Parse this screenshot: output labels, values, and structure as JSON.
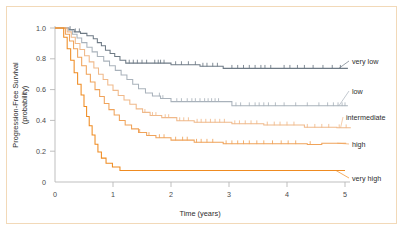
{
  "figure": {
    "border_color": "#f2d9b8",
    "background": "#ffffff"
  },
  "axes": {
    "x_title": "Time  (years)",
    "y_title_line1": "Progression-Free Survival",
    "y_title_line2": "(probability)",
    "x_ticks": [
      "0",
      "1",
      "2",
      "3",
      "4",
      "5"
    ],
    "y_ticks": [
      "0",
      "0.2",
      "0.4",
      "0.6",
      "0.8",
      "1.0"
    ],
    "axis_color": "#b8b8b8",
    "tick_text_color": "#4a4a4a"
  },
  "series_labels": {
    "very_low": "very low",
    "low": "low",
    "intermediate": "intermediate",
    "high": "high",
    "very_high": "very high"
  },
  "chart_data": {
    "type": "line",
    "title": "",
    "subtitle": "",
    "xlabel": "Time  (years)",
    "ylabel": "Progression-Free Survival (probability)",
    "xlim": [
      0,
      5.2
    ],
    "ylim": [
      0,
      1.05
    ],
    "xticks": [
      0,
      1,
      2,
      3,
      4,
      5
    ],
    "yticks": [
      0,
      0.2,
      0.4,
      0.6,
      0.8,
      1.0
    ],
    "grid": false,
    "legend_position": "right-inline-annotations",
    "curve_style": "kaplan-meier step function with censoring tick marks",
    "series": [
      {
        "name": "very low",
        "color": "#6e7a85",
        "plateau": 0.73,
        "final_value": 0.73,
        "steps": [
          [
            0.0,
            1.0
          ],
          [
            0.22,
            1.0
          ],
          [
            0.24,
            0.99
          ],
          [
            0.3,
            0.99
          ],
          [
            0.33,
            0.975
          ],
          [
            0.4,
            0.975
          ],
          [
            0.44,
            0.965
          ],
          [
            0.5,
            0.965
          ],
          [
            0.55,
            0.95
          ],
          [
            0.62,
            0.95
          ],
          [
            0.66,
            0.93
          ],
          [
            0.7,
            0.93
          ],
          [
            0.73,
            0.905
          ],
          [
            0.78,
            0.905
          ],
          [
            0.8,
            0.885
          ],
          [
            0.84,
            0.885
          ],
          [
            0.87,
            0.855
          ],
          [
            0.92,
            0.855
          ],
          [
            0.95,
            0.835
          ],
          [
            1.0,
            0.835
          ],
          [
            1.03,
            0.815
          ],
          [
            1.08,
            0.815
          ],
          [
            1.12,
            0.79
          ],
          [
            1.18,
            0.79
          ],
          [
            1.22,
            0.772
          ],
          [
            1.95,
            0.772
          ],
          [
            2.0,
            0.762
          ],
          [
            2.45,
            0.762
          ],
          [
            2.5,
            0.752
          ],
          [
            2.85,
            0.752
          ],
          [
            2.9,
            0.738
          ],
          [
            5.05,
            0.738
          ]
        ],
        "censor_times": [
          0.26,
          0.35,
          0.42,
          1.28,
          1.35,
          1.42,
          1.5,
          1.58,
          1.72,
          1.78,
          1.82,
          1.88,
          2.08,
          2.18,
          2.3,
          2.42,
          2.55,
          2.62,
          2.72,
          2.8,
          3.05,
          3.15,
          3.25,
          3.35,
          3.45,
          3.55,
          3.62,
          3.72,
          3.95,
          4.05,
          4.18,
          4.3,
          4.45,
          4.62,
          4.78,
          4.92
        ]
      },
      {
        "name": "low",
        "color": "#a9b2bb",
        "plateau": 0.495,
        "final_value": 0.495,
        "steps": [
          [
            0.0,
            1.0
          ],
          [
            0.2,
            1.0
          ],
          [
            0.23,
            0.985
          ],
          [
            0.27,
            0.985
          ],
          [
            0.3,
            0.96
          ],
          [
            0.35,
            0.96
          ],
          [
            0.38,
            0.935
          ],
          [
            0.43,
            0.935
          ],
          [
            0.46,
            0.905
          ],
          [
            0.52,
            0.905
          ],
          [
            0.55,
            0.875
          ],
          [
            0.6,
            0.875
          ],
          [
            0.64,
            0.845
          ],
          [
            0.7,
            0.845
          ],
          [
            0.73,
            0.815
          ],
          [
            0.8,
            0.815
          ],
          [
            0.84,
            0.785
          ],
          [
            0.9,
            0.785
          ],
          [
            0.94,
            0.755
          ],
          [
            1.0,
            0.755
          ],
          [
            1.04,
            0.725
          ],
          [
            1.1,
            0.725
          ],
          [
            1.14,
            0.695
          ],
          [
            1.2,
            0.695
          ],
          [
            1.24,
            0.665
          ],
          [
            1.3,
            0.665
          ],
          [
            1.34,
            0.635
          ],
          [
            1.4,
            0.635
          ],
          [
            1.44,
            0.605
          ],
          [
            1.52,
            0.605
          ],
          [
            1.56,
            0.578
          ],
          [
            1.64,
            0.578
          ],
          [
            1.68,
            0.558
          ],
          [
            1.78,
            0.558
          ],
          [
            1.82,
            0.542
          ],
          [
            1.95,
            0.542
          ],
          [
            2.0,
            0.522
          ],
          [
            3.0,
            0.522
          ],
          [
            3.05,
            0.495
          ],
          [
            5.05,
            0.495
          ]
        ],
        "censor_times": [
          1.8,
          1.86,
          2.1,
          2.18,
          2.28,
          2.36,
          2.42,
          2.5,
          2.58,
          2.64,
          2.7,
          2.76,
          2.82,
          3.12,
          3.2,
          3.35,
          3.45,
          3.52,
          3.6,
          3.68,
          3.8,
          3.95,
          4.15,
          4.35,
          4.55,
          4.7,
          4.8,
          4.88,
          4.95,
          5.0
        ]
      },
      {
        "name": "intermediate",
        "color": "#f0b98a",
        "plateau": 0.355,
        "final_value": 0.352,
        "steps": [
          [
            0.0,
            1.0
          ],
          [
            0.18,
            1.0
          ],
          [
            0.21,
            0.975
          ],
          [
            0.25,
            0.975
          ],
          [
            0.28,
            0.94
          ],
          [
            0.32,
            0.94
          ],
          [
            0.35,
            0.9
          ],
          [
            0.4,
            0.9
          ],
          [
            0.43,
            0.86
          ],
          [
            0.48,
            0.86
          ],
          [
            0.51,
            0.82
          ],
          [
            0.56,
            0.82
          ],
          [
            0.59,
            0.78
          ],
          [
            0.64,
            0.78
          ],
          [
            0.67,
            0.74
          ],
          [
            0.72,
            0.74
          ],
          [
            0.75,
            0.7
          ],
          [
            0.8,
            0.7
          ],
          [
            0.83,
            0.665
          ],
          [
            0.88,
            0.665
          ],
          [
            0.91,
            0.63
          ],
          [
            0.97,
            0.63
          ],
          [
            1.0,
            0.595
          ],
          [
            1.06,
            0.595
          ],
          [
            1.09,
            0.562
          ],
          [
            1.15,
            0.562
          ],
          [
            1.19,
            0.532
          ],
          [
            1.25,
            0.532
          ],
          [
            1.29,
            0.505
          ],
          [
            1.36,
            0.505
          ],
          [
            1.4,
            0.475
          ],
          [
            1.47,
            0.475
          ],
          [
            1.51,
            0.452
          ],
          [
            1.6,
            0.452
          ],
          [
            1.64,
            0.432
          ],
          [
            1.8,
            0.432
          ],
          [
            1.84,
            0.418
          ],
          [
            2.05,
            0.418
          ],
          [
            2.1,
            0.398
          ],
          [
            2.35,
            0.398
          ],
          [
            2.4,
            0.388
          ],
          [
            3.0,
            0.388
          ],
          [
            3.05,
            0.378
          ],
          [
            3.55,
            0.378
          ],
          [
            3.6,
            0.37
          ],
          [
            4.25,
            0.37
          ],
          [
            4.3,
            0.355
          ],
          [
            4.82,
            0.355
          ],
          [
            4.86,
            0.352
          ],
          [
            5.1,
            0.352
          ]
        ],
        "censor_times": [
          1.55,
          1.68,
          1.74,
          1.9,
          1.96,
          2.15,
          2.22,
          2.3,
          2.45,
          2.52,
          2.6,
          2.68,
          2.76,
          2.84,
          2.92,
          3.1,
          3.18,
          3.28,
          3.38,
          3.48,
          3.66,
          3.78,
          3.88,
          4.0,
          4.12,
          4.35,
          4.48,
          4.6,
          4.72,
          4.9,
          5.02
        ]
      },
      {
        "name": "high",
        "color": "#f0a35a",
        "plateau": 0.243,
        "final_value": 0.252,
        "steps": [
          [
            0.0,
            1.0
          ],
          [
            0.15,
            1.0
          ],
          [
            0.18,
            0.96
          ],
          [
            0.22,
            0.96
          ],
          [
            0.25,
            0.915
          ],
          [
            0.29,
            0.915
          ],
          [
            0.32,
            0.865
          ],
          [
            0.36,
            0.865
          ],
          [
            0.39,
            0.81
          ],
          [
            0.43,
            0.81
          ],
          [
            0.46,
            0.755
          ],
          [
            0.51,
            0.755
          ],
          [
            0.54,
            0.7
          ],
          [
            0.58,
            0.7
          ],
          [
            0.61,
            0.65
          ],
          [
            0.66,
            0.65
          ],
          [
            0.69,
            0.6
          ],
          [
            0.74,
            0.6
          ],
          [
            0.77,
            0.555
          ],
          [
            0.82,
            0.555
          ],
          [
            0.85,
            0.51
          ],
          [
            0.9,
            0.51
          ],
          [
            0.93,
            0.47
          ],
          [
            0.99,
            0.47
          ],
          [
            1.02,
            0.435
          ],
          [
            1.08,
            0.435
          ],
          [
            1.11,
            0.4
          ],
          [
            1.17,
            0.4
          ],
          [
            1.21,
            0.37
          ],
          [
            1.28,
            0.37
          ],
          [
            1.32,
            0.345
          ],
          [
            1.4,
            0.345
          ],
          [
            1.44,
            0.322
          ],
          [
            1.54,
            0.322
          ],
          [
            1.58,
            0.302
          ],
          [
            1.7,
            0.302
          ],
          [
            1.74,
            0.288
          ],
          [
            1.95,
            0.288
          ],
          [
            2.0,
            0.272
          ],
          [
            2.35,
            0.272
          ],
          [
            2.4,
            0.258
          ],
          [
            2.85,
            0.258
          ],
          [
            2.9,
            0.248
          ],
          [
            4.3,
            0.248
          ],
          [
            4.35,
            0.243
          ],
          [
            4.55,
            0.243
          ],
          [
            4.6,
            0.252
          ],
          [
            5.02,
            0.252
          ]
        ],
        "censor_times": [
          1.46,
          1.62,
          1.8,
          1.88,
          2.08,
          2.2,
          2.28,
          2.44,
          2.52,
          2.62,
          2.72,
          2.95,
          3.05,
          3.15,
          3.25,
          3.35,
          3.48,
          3.6,
          3.75,
          3.9,
          4.02,
          4.15,
          4.4
        ]
      },
      {
        "name": "very high",
        "color": "#ef8b21",
        "plateau": 0.075,
        "final_value": 0.075,
        "steps": [
          [
            0.0,
            1.0
          ],
          [
            0.12,
            1.0
          ],
          [
            0.15,
            0.94
          ],
          [
            0.18,
            0.94
          ],
          [
            0.21,
            0.865
          ],
          [
            0.24,
            0.865
          ],
          [
            0.27,
            0.79
          ],
          [
            0.3,
            0.79
          ],
          [
            0.33,
            0.71
          ],
          [
            0.36,
            0.71
          ],
          [
            0.39,
            0.635
          ],
          [
            0.42,
            0.635
          ],
          [
            0.45,
            0.565
          ],
          [
            0.475,
            0.565
          ],
          [
            0.5,
            0.49
          ],
          [
            0.52,
            0.49
          ],
          [
            0.545,
            0.425
          ],
          [
            0.57,
            0.425
          ],
          [
            0.59,
            0.365
          ],
          [
            0.615,
            0.365
          ],
          [
            0.64,
            0.305
          ],
          [
            0.665,
            0.305
          ],
          [
            0.69,
            0.245
          ],
          [
            0.715,
            0.245
          ],
          [
            0.74,
            0.195
          ],
          [
            0.77,
            0.195
          ],
          [
            0.8,
            0.155
          ],
          [
            0.84,
            0.155
          ],
          [
            0.88,
            0.122
          ],
          [
            0.95,
            0.122
          ],
          [
            0.99,
            0.098
          ],
          [
            1.08,
            0.098
          ],
          [
            1.12,
            0.075
          ],
          [
            5.0,
            0.075
          ]
        ],
        "censor_times": []
      }
    ]
  },
  "annotations": {
    "very_low": {
      "label": "very low",
      "anchor_x": 5.05,
      "anchor_y": 0.738
    },
    "low": {
      "label": "low",
      "anchor_x": 5.05,
      "anchor_y": 0.495
    },
    "intermediate": {
      "label": "intermediate",
      "anchor_x": 5.1,
      "anchor_y": 0.352
    },
    "high": {
      "label": "high",
      "anchor_x": 5.02,
      "anchor_y": 0.252
    },
    "very_high": {
      "label": "very high",
      "anchor_x": 5.0,
      "anchor_y": 0.075
    }
  }
}
